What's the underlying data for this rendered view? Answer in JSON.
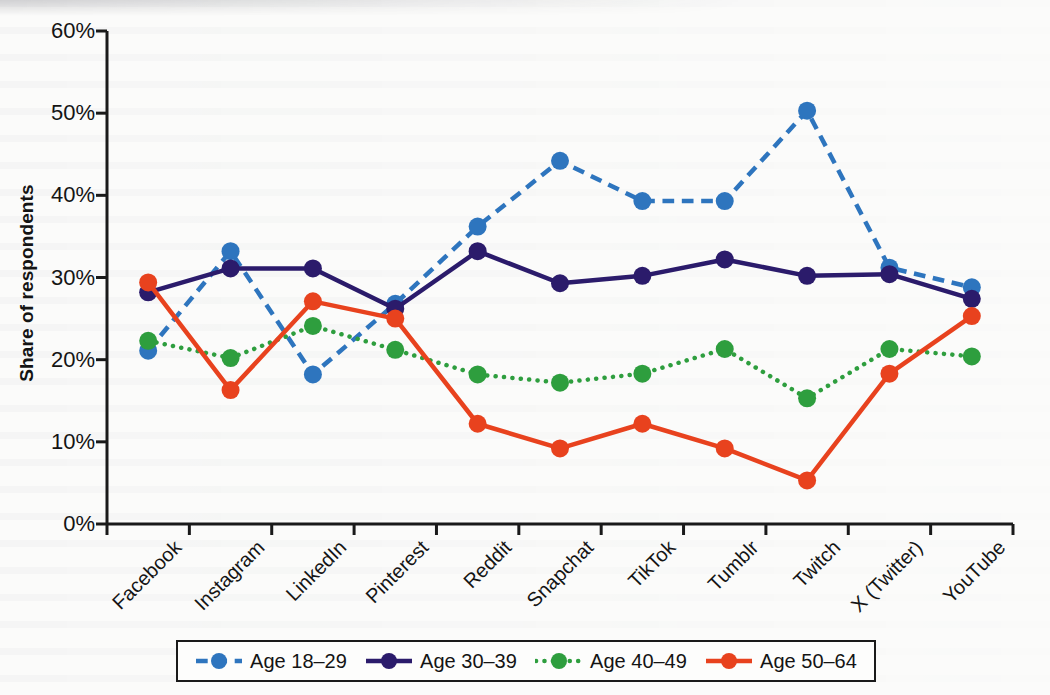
{
  "chart_data": {
    "type": "line",
    "title": "",
    "xlabel": "",
    "ylabel": "Share of respondents",
    "ylim": [
      0,
      60
    ],
    "ytick_labels": [
      "0%",
      "10%",
      "20%",
      "30%",
      "40%",
      "50%",
      "60%"
    ],
    "ytick_values": [
      0,
      10,
      20,
      30,
      40,
      50,
      60
    ],
    "grid": false,
    "legend_position": "bottom",
    "categories": [
      "Facebook",
      "Instagram",
      "LinkedIn",
      "Pinterest",
      "Reddit",
      "Snapchat",
      "TikTok",
      "Tumblr",
      "Twitch",
      "X (Twitter)",
      "YouTube"
    ],
    "series": [
      {
        "name": "Age 18–29",
        "color": "#2E75BE",
        "linestyle": "dashed",
        "marker": "circle",
        "values": [
          21.1,
          33.2,
          18.2,
          26.8,
          36.2,
          44.2,
          39.3,
          39.3,
          50.3,
          31.2,
          28.8
        ]
      },
      {
        "name": "Age 30–39",
        "color": "#2B1B6B",
        "linestyle": "solid",
        "marker": "circle",
        "values": [
          28.2,
          31.1,
          31.1,
          26.2,
          33.2,
          29.3,
          30.2,
          32.2,
          30.2,
          30.4,
          27.4
        ]
      },
      {
        "name": "Age 40–49",
        "color": "#2E9E3E",
        "linestyle": "dotted",
        "marker": "circle",
        "values": [
          22.3,
          20.2,
          24.1,
          21.2,
          18.2,
          17.2,
          18.3,
          21.3,
          15.3,
          21.3,
          20.4
        ]
      },
      {
        "name": "Age 50–64",
        "color": "#E8421E",
        "linestyle": "solid",
        "marker": "circle",
        "values": [
          29.4,
          16.3,
          27.1,
          25.0,
          12.2,
          9.2,
          12.2,
          9.2,
          5.3,
          18.3,
          25.3
        ]
      }
    ]
  },
  "legend": {
    "items": [
      {
        "label": "Age 18–29"
      },
      {
        "label": "Age 30–39"
      },
      {
        "label": "Age 40–49"
      },
      {
        "label": "Age 50–64"
      }
    ]
  },
  "axes": {
    "y_axis_title": "Share of respondents"
  }
}
